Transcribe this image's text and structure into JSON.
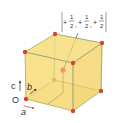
{
  "diagram": {
    "type": "body-centered cubic unit cell",
    "colors": {
      "face_fill": "#f7e08a",
      "face_fill_side": "#f3d677",
      "edge": "#9aa36a",
      "atom": "#d9452b",
      "atom_back": "#e8892e",
      "text": "#333333",
      "axis": "#333333"
    },
    "coordinate_label": {
      "open": "(",
      "terms": [
        {
          "sign": "+",
          "num": "1",
          "den": "2"
        },
        {
          "sign": "+",
          "num": "1",
          "den": "2"
        },
        {
          "sign": "+",
          "num": "1",
          "den": "2"
        }
      ],
      "separator": ",",
      "close": ")"
    },
    "axes": {
      "origin": "O",
      "a": "a",
      "b": "b",
      "c": "c"
    }
  }
}
